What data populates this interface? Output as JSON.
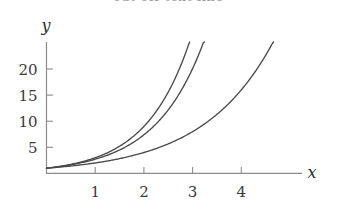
{
  "chart_data": {
    "type": "line",
    "title": "",
    "subtitle": "",
    "xlabel": "x",
    "ylabel": "y",
    "xlim": [
      -0.06,
      5.3
    ],
    "ylim": [
      0,
      26.5
    ],
    "grid": false,
    "legend": "none",
    "x_ticks": [
      1,
      2,
      3,
      4
    ],
    "x_tick_labels": [
      "1",
      "2",
      "3",
      "4"
    ],
    "y_ticks": [
      5,
      10,
      15,
      20
    ],
    "y_tick_labels": [
      "5",
      "10",
      "15",
      "20"
    ],
    "series": [
      {
        "name": "3^x",
        "base": 3,
        "color": "#4a4a4a",
        "x": [
          0,
          0.25,
          0.5,
          0.75,
          1,
          1.25,
          1.5,
          1.75,
          2,
          2.25,
          2.5,
          2.75,
          2.94
        ],
        "values": [
          1,
          1.32,
          1.73,
          2.28,
          3,
          3.95,
          5.2,
          6.84,
          9,
          11.84,
          15.59,
          20.51,
          25
        ]
      },
      {
        "name": "e^x",
        "base": 2.718,
        "color": "#4a4a4a",
        "x": [
          0,
          0.25,
          0.5,
          0.75,
          1,
          1.25,
          1.5,
          1.75,
          2,
          2.25,
          2.5,
          2.75,
          3,
          3.2
        ],
        "values": [
          1,
          1.28,
          1.65,
          2.12,
          2.72,
          3.49,
          4.48,
          5.75,
          7.39,
          9.49,
          12.18,
          15.64,
          20.09,
          24.5
        ]
      },
      {
        "name": "2^x",
        "base": 2,
        "color": "#4a4a4a",
        "x": [
          0,
          0.5,
          1,
          1.5,
          2,
          2.5,
          3,
          3.5,
          4,
          4.5,
          4.72
        ],
        "values": [
          1,
          1.41,
          2,
          2.83,
          4,
          5.66,
          8,
          11.31,
          16,
          22.63,
          26.4
        ]
      }
    ],
    "axis_labels": {
      "x_axis_name": "x",
      "y_axis_name": "y"
    }
  },
  "clipped_header": {
    "text": "cut off text line"
  },
  "style": {
    "curve_color": "#4a4a4a",
    "axis_color": "#8c8c8c",
    "tick_label_color": "#3a3a3a",
    "background": "#ffffff"
  }
}
